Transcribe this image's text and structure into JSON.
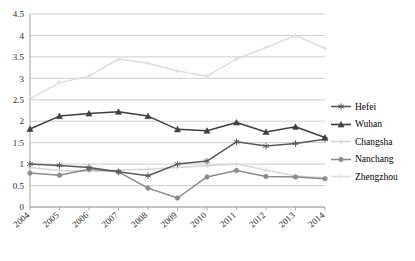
{
  "chart_data": {
    "type": "line",
    "title": "",
    "subtitle": "",
    "xlabel": "",
    "ylabel": "",
    "categories": [
      "2004",
      "2005",
      "2006",
      "2007",
      "2008",
      "2009",
      "2010",
      "2011",
      "2012",
      "2013",
      "2014"
    ],
    "ylim": [
      0,
      4.5
    ],
    "ytick_step": 0.5,
    "yticks": [
      "0",
      "0.5",
      "1",
      "1.5",
      "2",
      "2.5",
      "3",
      "3.5",
      "4",
      "4.5"
    ],
    "grid": "horizontal",
    "legend_position": "right",
    "series": [
      {
        "name": "Hefei",
        "color": "#595959",
        "marker": "asterisk",
        "values": [
          1.0,
          0.97,
          0.92,
          0.82,
          0.73,
          1.0,
          1.07,
          1.52,
          1.42,
          1.48,
          1.58
        ]
      },
      {
        "name": "Wuhan",
        "color": "#3f3f3f",
        "marker": "triangle",
        "values": [
          1.82,
          2.12,
          2.18,
          2.22,
          2.12,
          1.81,
          1.78,
          1.97,
          1.75,
          1.87,
          1.62
        ]
      },
      {
        "name": "Changsha",
        "color": "#d5d5d5",
        "marker": "plus",
        "values": [
          0.92,
          0.85,
          0.83,
          0.86,
          0.88,
          0.92,
          0.96,
          1.0,
          0.86,
          0.72,
          0.68
        ]
      },
      {
        "name": "Nanchang",
        "color": "#8c8c8c",
        "marker": "circle",
        "values": [
          0.79,
          0.74,
          0.88,
          0.82,
          0.44,
          0.21,
          0.7,
          0.85,
          0.71,
          0.7,
          0.66
        ]
      },
      {
        "name": "Zhengzhou",
        "color": "#dedede",
        "marker": "plus",
        "values": [
          2.52,
          2.9,
          3.05,
          3.45,
          3.35,
          3.17,
          3.05,
          3.45,
          3.72,
          4.0,
          3.7
        ]
      }
    ]
  },
  "legend": {
    "items": [
      {
        "label": "Hefei"
      },
      {
        "label": "Wuhan"
      },
      {
        "label": "Changsha"
      },
      {
        "label": "Nanchang"
      },
      {
        "label": "Zhengzhou"
      }
    ]
  },
  "axis_colors": {
    "grid": "#b9b9b9",
    "axis": "#9a9a9a",
    "text": "#2b2b2b"
  }
}
